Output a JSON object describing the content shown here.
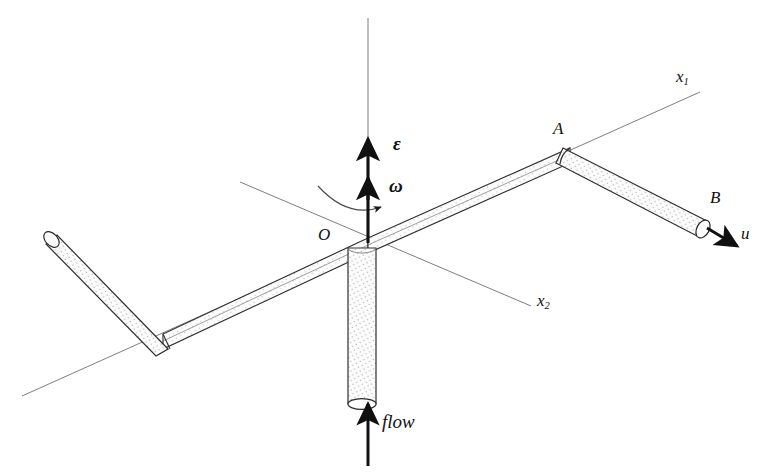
{
  "figure": {
    "type": "engineering-diagram",
    "background_color": "#ffffff",
    "line_color": "#2b2b2b",
    "fill_color": "#fbfbfb",
    "stipple_color": "#8d8d8d"
  },
  "labels": {
    "origin": "O",
    "point_a": "A",
    "point_b": "B",
    "axis_x1_base": "x",
    "axis_x1_sub": "1",
    "axis_x2_base": "x",
    "axis_x2_sub": "2",
    "angular_acceleration": "ε",
    "angular_velocity": "ω",
    "exit_velocity": "u",
    "inlet": "flow"
  },
  "annotations": [
    {
      "name": "origin",
      "text": "O",
      "x": 318,
      "y": 233
    },
    {
      "name": "point-a",
      "text": "A",
      "x": 553,
      "y": 126
    },
    {
      "name": "point-b",
      "text": "B",
      "x": 710,
      "y": 195
    },
    {
      "name": "axis-x1",
      "text": "x1",
      "x": 676,
      "y": 74
    },
    {
      "name": "axis-x2",
      "text": "x2",
      "x": 537,
      "y": 298
    },
    {
      "name": "angular-acceleration",
      "text": "ε",
      "x": 393,
      "y": 142
    },
    {
      "name": "angular-velocity",
      "text": "ω",
      "x": 389,
      "y": 183
    },
    {
      "name": "exit-velocity",
      "text": "u",
      "x": 741,
      "y": 231
    },
    {
      "name": "inlet-flow",
      "text": "flow",
      "x": 382,
      "y": 420
    }
  ],
  "geometry": {
    "origin_point": [
      368,
      243
    ],
    "vertical_axis": {
      "x": 368,
      "y_top": 18,
      "y_bottom": 243
    },
    "axis_x1": {
      "from": [
        22,
        396
      ],
      "to": [
        700,
        92
      ]
    },
    "axis_x2": {
      "from": [
        240,
        182
      ],
      "to": [
        531,
        306
      ]
    },
    "supply_pipe": {
      "x_left": 348,
      "x_right": 376,
      "y_top": 245,
      "y_bottom": 408
    },
    "arm_right": {
      "from": [
        368,
        246
      ],
      "to": [
        568,
        156
      ]
    },
    "arm_left": {
      "from": [
        368,
        250
      ],
      "to": [
        163,
        346
      ]
    },
    "nozzle_right": {
      "from": [
        568,
        152
      ],
      "to": [
        712,
        232
      ]
    },
    "nozzle_left": {
      "from": [
        163,
        342
      ],
      "to": [
        52,
        228
      ]
    },
    "flow_arrow": {
      "from": [
        368,
        466
      ],
      "to": [
        368,
        408
      ]
    },
    "epsilon_arrow": {
      "from": [
        368,
        243
      ],
      "to": [
        368,
        140
      ]
    },
    "omega_arrow": {
      "from": [
        368,
        243
      ],
      "to": [
        368,
        180
      ]
    }
  }
}
